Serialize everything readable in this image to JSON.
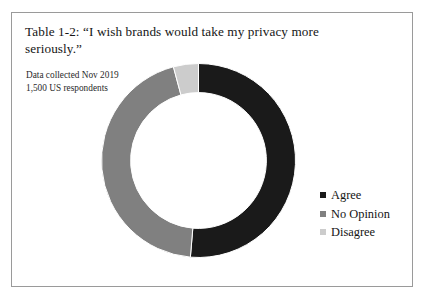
{
  "figure": {
    "title": "Table 1-2: “I wish brands would take my privacy more seriously.”",
    "subtitle_line1": "Data collected Nov 2019",
    "subtitle_line2": "1,500 US respondents",
    "border_color": "#9a9a9a",
    "background_color": "#ffffff"
  },
  "legend": {
    "position": "right",
    "items": [
      {
        "label": "Agree",
        "color": "#1a1a1a"
      },
      {
        "label": "No Opinion",
        "color": "#808080"
      },
      {
        "label": "Disagree",
        "color": "#cccccc"
      }
    ]
  },
  "chart_data": {
    "type": "pie",
    "variant": "donut",
    "title": "Table 1-2: “I wish brands would take my privacy more seriously.”",
    "subtitle": "Data collected Nov 2019 / 1,500 US respondents",
    "categories": [
      "Agree",
      "No Opinion",
      "Disagree"
    ],
    "values": [
      51,
      45,
      4
    ],
    "value_unit": "percent",
    "colors": [
      "#1a1a1a",
      "#808080",
      "#cccccc"
    ],
    "start_angle_deg": 0,
    "direction": "clockwise",
    "inner_radius_ratio": 0.7,
    "legend": "right",
    "data_labels": false,
    "grid": false,
    "segments": [
      {
        "name": "Agree",
        "value": 51,
        "start_deg": 0,
        "end_deg": 184.8,
        "color": "#1a1a1a"
      },
      {
        "name": "No Opinion",
        "value": 45,
        "start_deg": 184.8,
        "end_deg": 345.0,
        "color": "#808080"
      },
      {
        "name": "Disagree",
        "value": 4,
        "start_deg": 345.0,
        "end_deg": 360.0,
        "color": "#cccccc"
      }
    ]
  }
}
